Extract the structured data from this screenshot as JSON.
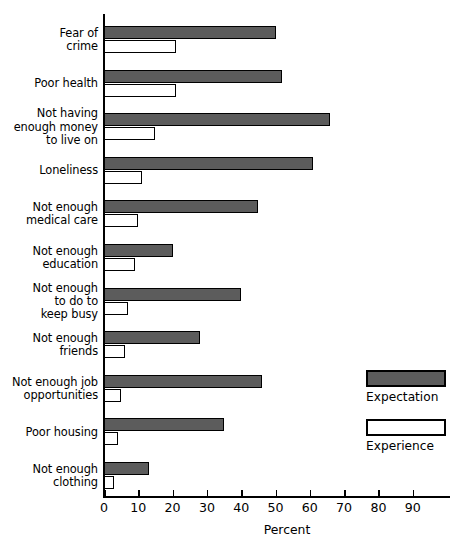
{
  "chart_data": {
    "type": "bar",
    "orientation": "horizontal",
    "title": "",
    "xlabel": "Percent",
    "ylabel": "",
    "xlim": [
      0,
      100
    ],
    "xticks": [
      0,
      10,
      20,
      30,
      40,
      50,
      60,
      70,
      80,
      90
    ],
    "xtick_labels": [
      "0",
      "10",
      "20",
      "30",
      "40",
      "50",
      "60",
      "70",
      "80",
      "90"
    ],
    "grid": false,
    "legend_position": "right-middle",
    "categories": [
      "Fear of\ncrime",
      "Poor health",
      "Not having\nenough money\nto live on",
      "Loneliness",
      "Not enough\nmedical care",
      "Not enough\neducation",
      "Not enough\nto do to\nkeep busy",
      "Not enough\nfriends",
      "Not enough job\nopportunities",
      "Poor housing",
      "Not enough\nclothing"
    ],
    "series": [
      {
        "name": "Expectation",
        "color": "#5c5c5c",
        "values": [
          50,
          52,
          66,
          61,
          45,
          20,
          40,
          28,
          46,
          35,
          13
        ]
      },
      {
        "name": "Experience",
        "color": "#ffffff",
        "values": [
          21,
          21,
          15,
          11,
          10,
          9,
          7,
          6,
          5,
          4,
          3
        ]
      }
    ]
  },
  "legend": {
    "items": [
      {
        "label": "Expectation",
        "swatch": "expectation"
      },
      {
        "label": "Experience",
        "swatch": "experience"
      }
    ]
  }
}
